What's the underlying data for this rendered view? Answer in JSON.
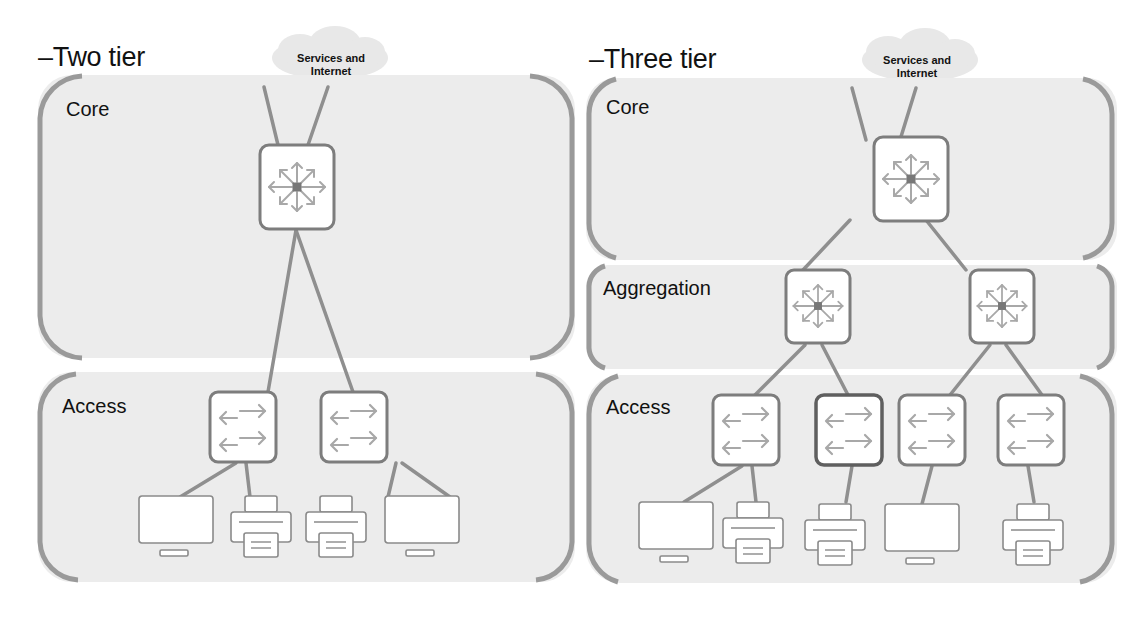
{
  "diagrams": [
    {
      "title": "–Two tier",
      "cloud_label_line1": "Services and",
      "cloud_label_line2": "Internet",
      "zones": [
        {
          "label": "Core"
        },
        {
          "label": "Access"
        }
      ],
      "devices": {
        "core_switches": 1,
        "access_switches": 2,
        "endpoints": [
          "monitor",
          "printer",
          "printer",
          "monitor"
        ]
      }
    },
    {
      "title": "–Three tier",
      "cloud_label_line1": "Services and",
      "cloud_label_line2": "Internet",
      "zones": [
        {
          "label": "Core"
        },
        {
          "label": "Aggregation"
        },
        {
          "label": "Access"
        }
      ],
      "devices": {
        "core_switches": 1,
        "aggregation_switches": 2,
        "access_switches": 4,
        "endpoints": [
          "monitor",
          "printer",
          "printer",
          "monitor",
          "printer"
        ]
      }
    }
  ],
  "colors": {
    "zone_fill": "#ececec",
    "bracket": "#9a9a9a",
    "link": "#8f8f8f",
    "device_border": "#7d7d7d",
    "device_fill": "#ffffff",
    "arrow": "#a8a8a8",
    "cloud": "#e6e6e6"
  }
}
